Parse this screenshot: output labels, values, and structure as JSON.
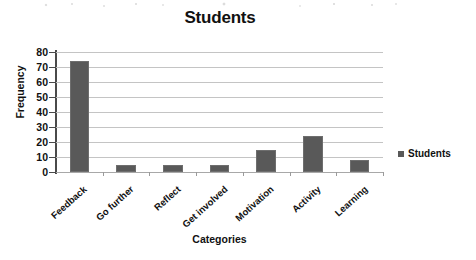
{
  "chart_data": {
    "type": "bar",
    "title": "Students",
    "xlabel": "Categories",
    "ylabel": "Frequency",
    "categories": [
      "Feedback",
      "Go further",
      "Reflect",
      "Get involved",
      "Motivation",
      "Activity",
      "Learning"
    ],
    "values": [
      74,
      5,
      5,
      5,
      15,
      24,
      8
    ],
    "series": [
      {
        "name": "Students",
        "values": [
          74,
          5,
          5,
          5,
          15,
          24,
          8
        ]
      }
    ],
    "ylim": [
      0,
      80
    ],
    "yticks": [
      0,
      10,
      20,
      30,
      40,
      50,
      60,
      70,
      80
    ],
    "ytick_labels": [
      "0",
      "10",
      "20",
      "30",
      "40",
      "50",
      "60",
      "70",
      "80"
    ],
    "grid": true,
    "grid_axis": "y",
    "legend": {
      "position": "right",
      "entries": [
        {
          "label": "Students",
          "color": "#595959"
        }
      ]
    },
    "bar_color": "#595959",
    "gridline_color": "#c4c4c4",
    "axis_color": "#4a4a4a"
  }
}
